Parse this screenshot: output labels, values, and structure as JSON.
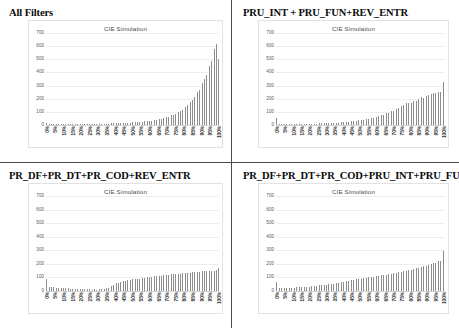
{
  "document": {
    "panel_count": 4
  },
  "panels": [
    {
      "id": "all-filters",
      "heading": "All Filters",
      "chart_index": 0
    },
    {
      "id": "pru-int-pru-fun-rev-entr",
      "heading": "PRU_INT + PRU_FUN+REV_ENTR",
      "chart_index": 1
    },
    {
      "id": "pr-df-pr-dt-pr-cod-rev-entr",
      "heading": "PR_DF+PR_DT+PR_COD+REV_ENTR",
      "chart_index": 2
    },
    {
      "id": "pr-df-pr-dt-pr-cod-pru-int-pru-fun",
      "heading": "PR_DF+PR_DT+PR_COD+PRU_INT+PRU_FUN",
      "chart_index": 3
    }
  ],
  "axis": {
    "y_ticks": [
      700,
      600,
      500,
      400,
      300,
      200,
      100,
      0
    ],
    "y_min": 0,
    "y_max": 700,
    "x_categories": [
      "0%",
      "5%",
      "10%",
      "15%",
      "20%",
      "25%",
      "30%",
      "35%",
      "40%",
      "45%",
      "50%",
      "55%",
      "60%",
      "65%",
      "70%",
      "75%",
      "80%",
      "85%",
      "90%",
      "95%",
      "100%"
    ]
  },
  "colors": {
    "bar": "#8d8d8d",
    "gridline": "#ededed",
    "frame": "#e2e2e2",
    "divider": "#4a4a4a",
    "text": "#000000"
  },
  "chart_data": [
    {
      "type": "bar",
      "title": "CIE Simulation",
      "xlabel": "",
      "ylabel": "",
      "ylim": [
        0,
        700
      ],
      "grid": true,
      "legend": "none",
      "tick_labels": [
        "0%",
        "5%",
        "10%",
        "15%",
        "20%",
        "25%",
        "30%",
        "35%",
        "40%",
        "45%",
        "50%",
        "55%",
        "60%",
        "65%",
        "70%",
        "75%",
        "80%",
        "85%",
        "90%",
        "95%",
        "100%"
      ],
      "values": [
        14,
        6,
        5,
        5,
        4,
        4,
        5,
        5,
        4,
        5,
        5,
        5,
        6,
        5,
        6,
        6,
        6,
        7,
        6,
        7,
        7,
        7,
        8,
        7,
        8,
        8,
        8,
        8,
        9,
        9,
        9,
        9,
        10,
        10,
        10,
        11,
        11,
        11,
        12,
        12,
        13,
        13,
        14,
        14,
        15,
        16,
        16,
        17,
        18,
        19,
        20,
        20,
        21,
        22,
        24,
        25,
        26,
        27,
        29,
        30,
        32,
        34,
        36,
        38,
        40,
        43,
        46,
        49,
        52,
        56,
        60,
        64,
        69,
        74,
        80,
        86,
        93,
        101,
        109,
        118,
        128,
        139,
        151,
        164,
        178,
        193,
        210,
        228,
        248,
        270,
        294,
        320,
        348,
        379,
        412,
        448,
        487,
        530,
        575,
        620,
        500
      ]
    },
    {
      "type": "bar",
      "title": "CIE Simulation",
      "xlabel": "",
      "ylabel": "",
      "ylim": [
        0,
        700
      ],
      "grid": true,
      "legend": "none",
      "tick_labels": [
        "0%",
        "5%",
        "10%",
        "15%",
        "20%",
        "25%",
        "30%",
        "35%",
        "40%",
        "45%",
        "50%",
        "55%",
        "60%",
        "65%",
        "70%",
        "75%",
        "80%",
        "85%",
        "90%",
        "95%",
        "100%"
      ],
      "values": [
        55,
        8,
        6,
        6,
        6,
        6,
        6,
        6,
        6,
        7,
        7,
        7,
        7,
        7,
        8,
        8,
        8,
        8,
        9,
        9,
        9,
        10,
        10,
        10,
        11,
        11,
        12,
        12,
        13,
        13,
        14,
        14,
        15,
        16,
        16,
        17,
        18,
        19,
        20,
        21,
        22,
        23,
        24,
        25,
        27,
        28,
        30,
        31,
        33,
        35,
        37,
        39,
        41,
        43,
        46,
        48,
        51,
        54,
        57,
        60,
        63,
        67,
        71,
        75,
        79,
        83,
        88,
        93,
        98,
        103,
        109,
        115,
        121,
        128,
        135,
        142,
        150,
        158,
        166,
        168,
        155,
        170,
        180,
        190,
        185,
        200,
        196,
        210,
        205,
        215,
        222,
        230,
        228,
        235,
        240,
        245,
        238,
        250,
        248,
        255,
        330
      ]
    },
    {
      "type": "bar",
      "title": "CIE Simulation",
      "xlabel": "",
      "ylabel": "",
      "ylim": [
        0,
        700
      ],
      "grid": true,
      "legend": "none",
      "tick_labels": [
        "0%",
        "5%",
        "10%",
        "15%",
        "20%",
        "25%",
        "30%",
        "35%",
        "40%",
        "45%",
        "50%",
        "55%",
        "60%",
        "65%",
        "70%",
        "75%",
        "80%",
        "85%",
        "90%",
        "95%",
        "100%"
      ],
      "values": [
        92,
        40,
        32,
        28,
        30,
        26,
        24,
        25,
        22,
        20,
        21,
        19,
        18,
        19,
        17,
        16,
        17,
        15,
        16,
        14,
        15,
        13,
        14,
        13,
        12,
        13,
        12,
        11,
        12,
        11,
        12,
        13,
        14,
        16,
        18,
        20,
        24,
        30,
        38,
        46,
        52,
        58,
        62,
        66,
        70,
        72,
        75,
        78,
        80,
        82,
        85,
        86,
        88,
        90,
        92,
        94,
        96,
        98,
        100,
        101,
        103,
        104,
        106,
        107,
        109,
        110,
        112,
        113,
        115,
        116,
        118,
        119,
        120,
        122,
        123,
        124,
        126,
        127,
        128,
        130,
        131,
        132,
        134,
        135,
        136,
        137,
        138,
        140,
        141,
        142,
        143,
        144,
        145,
        146,
        147,
        148,
        149,
        150,
        151,
        152,
        170
      ]
    },
    {
      "type": "bar",
      "title": "CIE Simulation",
      "xlabel": "",
      "ylabel": "",
      "ylim": [
        0,
        700
      ],
      "grid": true,
      "legend": "none",
      "tick_labels": [
        "0%",
        "5%",
        "10%",
        "15%",
        "20%",
        "25%",
        "30%",
        "35%",
        "40%",
        "45%",
        "50%",
        "55%",
        "60%",
        "65%",
        "70%",
        "75%",
        "80%",
        "85%",
        "90%",
        "95%",
        "100%"
      ],
      "values": [
        70,
        28,
        24,
        22,
        24,
        22,
        21,
        23,
        22,
        24,
        26,
        25,
        27,
        26,
        28,
        30,
        29,
        32,
        31,
        34,
        33,
        36,
        38,
        37,
        40,
        42,
        41,
        44,
        46,
        48,
        47,
        50,
        52,
        55,
        54,
        57,
        60,
        62,
        65,
        64,
        68,
        70,
        73,
        72,
        76,
        79,
        78,
        82,
        85,
        88,
        87,
        91,
        94,
        92,
        97,
        100,
        98,
        103,
        106,
        104,
        109,
        112,
        110,
        115,
        118,
        116,
        121,
        124,
        122,
        128,
        131,
        129,
        135,
        138,
        136,
        142,
        146,
        144,
        150,
        154,
        152,
        158,
        162,
        160,
        168,
        172,
        170,
        178,
        182,
        180,
        188,
        194,
        192,
        200,
        206,
        204,
        212,
        220,
        218,
        228,
        292
      ]
    }
  ]
}
